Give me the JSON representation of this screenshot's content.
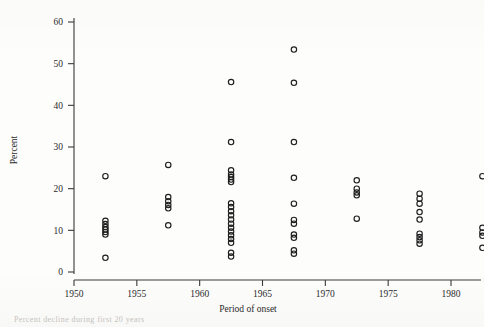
{
  "figure": {
    "background_color": "#fdfdfc",
    "ink_color": "#1f1f1f",
    "marker_style": "open-circle"
  },
  "axis": {
    "y_title": "Percent",
    "x_title": "Period of onset",
    "y_ticks": [
      "0",
      "10",
      "20",
      "30",
      "40",
      "50",
      "60"
    ],
    "x_ticks": [
      "1950",
      "1955",
      "1960",
      "1965",
      "1970",
      "1975",
      "1980"
    ]
  },
  "caption": {
    "partial_text": "Percent decline during first 20 years"
  },
  "chart_data": {
    "type": "scatter",
    "title": "",
    "subtitle": "",
    "xlabel": "Period of onset",
    "ylabel": "Percent",
    "xlim": [
      1948.5,
      1983.5
    ],
    "ylim": [
      -2,
      63
    ],
    "grid": false,
    "legend": null,
    "marker": "open-circle",
    "series": [
      {
        "name": "Percent decline by period of onset",
        "points": [
          {
            "x": 1952.5,
            "y": 23.0
          },
          {
            "x": 1952.5,
            "y": 12.3
          },
          {
            "x": 1952.5,
            "y": 11.5
          },
          {
            "x": 1952.5,
            "y": 10.8
          },
          {
            "x": 1952.5,
            "y": 10.2
          },
          {
            "x": 1952.5,
            "y": 9.6
          },
          {
            "x": 1952.5,
            "y": 9.0
          },
          {
            "x": 1952.5,
            "y": 3.4
          },
          {
            "x": 1957.5,
            "y": 25.7
          },
          {
            "x": 1957.5,
            "y": 18.0
          },
          {
            "x": 1957.5,
            "y": 17.0
          },
          {
            "x": 1957.5,
            "y": 16.1
          },
          {
            "x": 1957.5,
            "y": 15.3
          },
          {
            "x": 1957.5,
            "y": 11.2
          },
          {
            "x": 1962.5,
            "y": 45.6
          },
          {
            "x": 1962.5,
            "y": 31.2
          },
          {
            "x": 1962.5,
            "y": 24.4
          },
          {
            "x": 1962.5,
            "y": 23.4
          },
          {
            "x": 1962.5,
            "y": 22.8
          },
          {
            "x": 1962.5,
            "y": 22.2
          },
          {
            "x": 1962.5,
            "y": 21.6
          },
          {
            "x": 1962.5,
            "y": 16.5
          },
          {
            "x": 1962.5,
            "y": 15.6
          },
          {
            "x": 1962.5,
            "y": 14.6
          },
          {
            "x": 1962.5,
            "y": 13.6
          },
          {
            "x": 1962.5,
            "y": 12.6
          },
          {
            "x": 1962.5,
            "y": 11.6
          },
          {
            "x": 1962.5,
            "y": 10.6
          },
          {
            "x": 1962.5,
            "y": 9.7
          },
          {
            "x": 1962.5,
            "y": 8.8
          },
          {
            "x": 1962.5,
            "y": 7.9
          },
          {
            "x": 1962.5,
            "y": 7.0
          },
          {
            "x": 1962.5,
            "y": 4.6
          },
          {
            "x": 1962.5,
            "y": 3.7
          },
          {
            "x": 1967.5,
            "y": 53.4
          },
          {
            "x": 1967.5,
            "y": 45.4
          },
          {
            "x": 1967.5,
            "y": 31.2
          },
          {
            "x": 1967.5,
            "y": 22.6
          },
          {
            "x": 1967.5,
            "y": 16.4
          },
          {
            "x": 1967.5,
            "y": 12.5
          },
          {
            "x": 1967.5,
            "y": 11.6
          },
          {
            "x": 1967.5,
            "y": 9.0
          },
          {
            "x": 1967.5,
            "y": 8.2
          },
          {
            "x": 1967.5,
            "y": 5.2
          },
          {
            "x": 1967.5,
            "y": 4.4
          },
          {
            "x": 1972.5,
            "y": 22.0
          },
          {
            "x": 1972.5,
            "y": 20.0
          },
          {
            "x": 1972.5,
            "y": 19.1
          },
          {
            "x": 1972.5,
            "y": 18.4
          },
          {
            "x": 1972.5,
            "y": 12.8
          },
          {
            "x": 1977.5,
            "y": 18.8
          },
          {
            "x": 1977.5,
            "y": 17.6
          },
          {
            "x": 1977.5,
            "y": 16.4
          },
          {
            "x": 1977.5,
            "y": 14.4
          },
          {
            "x": 1977.5,
            "y": 12.6
          },
          {
            "x": 1977.5,
            "y": 9.2
          },
          {
            "x": 1977.5,
            "y": 8.4
          },
          {
            "x": 1977.5,
            "y": 7.6
          },
          {
            "x": 1977.5,
            "y": 6.8
          },
          {
            "x": 1982.5,
            "y": 23.0
          },
          {
            "x": 1982.5,
            "y": 10.6
          },
          {
            "x": 1982.5,
            "y": 9.5
          },
          {
            "x": 1982.5,
            "y": 8.7
          },
          {
            "x": 1982.5,
            "y": 5.8
          }
        ]
      }
    ]
  }
}
